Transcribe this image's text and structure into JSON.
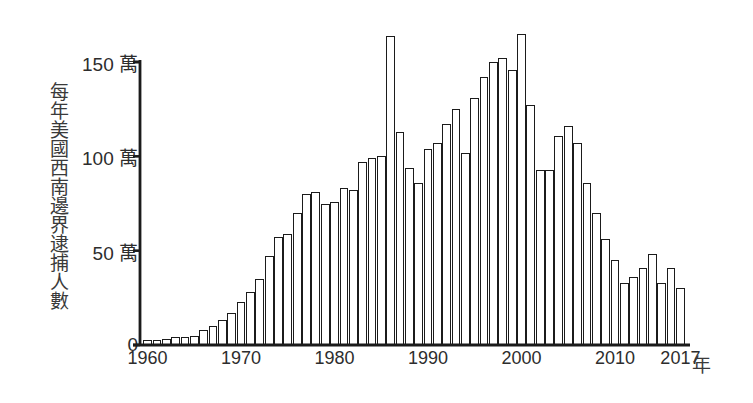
{
  "chart_data": {
    "type": "bar",
    "title": "",
    "subtitle": "",
    "ylabel": "每年美國西南邊界逮捕人數",
    "xlabel": "年",
    "grid": false,
    "legend": "none",
    "yunit": "萬",
    "ylim": [
      0,
      170
    ],
    "ytick_values": [
      0,
      50,
      100,
      150
    ],
    "ytick_labels": [
      "0",
      "50 萬",
      "100 萬",
      "150 萬"
    ],
    "xlim": [
      1959.4,
      2017.6
    ],
    "xtick_values": [
      1960,
      1970,
      1980,
      1990,
      2000,
      2010,
      2017
    ],
    "xtick_labels": [
      "1960",
      "1970",
      "1980",
      "1990",
      "2000",
      "2010",
      "2017"
    ],
    "categories": [
      1960,
      1961,
      1962,
      1963,
      1964,
      1965,
      1966,
      1967,
      1968,
      1969,
      1970,
      1971,
      1972,
      1973,
      1974,
      1975,
      1976,
      1977,
      1978,
      1979,
      1980,
      1981,
      1982,
      1983,
      1984,
      1985,
      1986,
      1987,
      1988,
      1989,
      1990,
      1991,
      1992,
      1993,
      1994,
      1995,
      1996,
      1997,
      1998,
      1999,
      2000,
      2001,
      2002,
      2003,
      2004,
      2005,
      2006,
      2007,
      2008,
      2009,
      2010,
      2011,
      2012,
      2013,
      2014,
      2015,
      2016,
      2017
    ],
    "values": [
      2.5,
      2.5,
      3.0,
      4.0,
      4.3,
      5.0,
      8.0,
      10.0,
      13.0,
      17.0,
      23.0,
      28.0,
      35.0,
      47.0,
      57.0,
      59.0,
      70.0,
      80.0,
      81.0,
      75.0,
      76.0,
      83.0,
      82.0,
      97.0,
      99.0,
      100.0,
      164.0,
      113.0,
      94.0,
      86.0,
      104.0,
      107.0,
      117.0,
      125.0,
      102.0,
      131.0,
      142.0,
      150.0,
      152.0,
      146.0,
      165.0,
      127.0,
      93.0,
      93.0,
      111.0,
      116.0,
      107.0,
      86.0,
      70.0,
      56.0,
      45.0,
      33.0,
      36.0,
      41.0,
      48.0,
      33.0,
      41.0,
      30.0
    ]
  },
  "axis": {
    "y_caption": "每年美國西南邊界逮捕人數",
    "x_caption": "年"
  },
  "colors": {
    "bar_fill": "#ffffff",
    "bar_stroke": "#1b1b1b",
    "axis": "#1b1b1b",
    "text": "#2d2d2d",
    "background": "#ffffff"
  }
}
